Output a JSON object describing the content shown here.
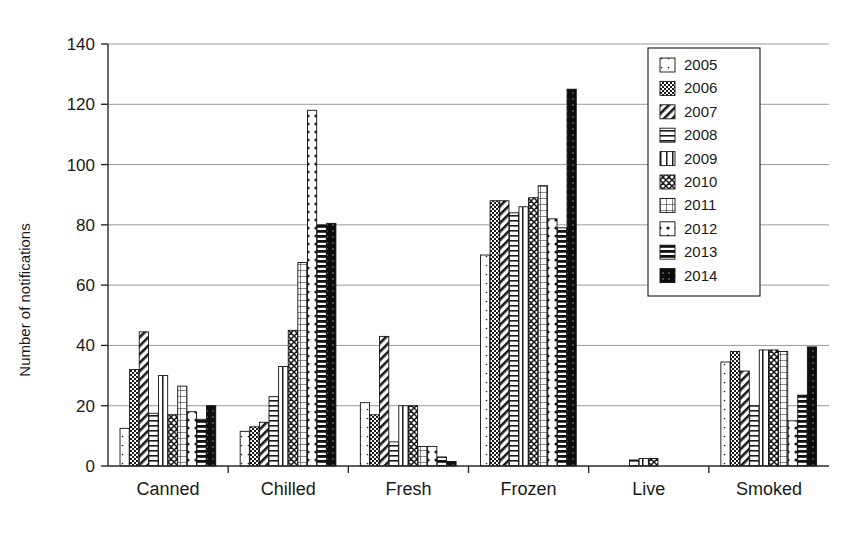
{
  "chart_data": {
    "type": "bar",
    "title": "",
    "xlabel": "",
    "ylabel": "Number of notifications",
    "ylim": [
      0,
      140
    ],
    "yticks": [
      0,
      20,
      40,
      60,
      80,
      100,
      120,
      140
    ],
    "grid": true,
    "legend_position": "top-right",
    "categories": [
      "Canned",
      "Chilled",
      "Fresh",
      "Frozen",
      "Live",
      "Smoked"
    ],
    "series": [
      {
        "name": "2005",
        "pattern": "sparse-dots",
        "values": [
          12.5,
          11.5,
          21.0,
          70.0,
          0.0,
          34.5
        ]
      },
      {
        "name": "2006",
        "pattern": "checker-dark",
        "values": [
          32.0,
          13.0,
          17.0,
          88.0,
          0.0,
          38.0
        ]
      },
      {
        "name": "2007",
        "pattern": "diagonal-left",
        "values": [
          44.5,
          14.5,
          43.0,
          88.0,
          0.0,
          31.5
        ]
      },
      {
        "name": "2008",
        "pattern": "horizontal-lines",
        "values": [
          17.5,
          23.0,
          8.0,
          84.0,
          2.0,
          20.0
        ]
      },
      {
        "name": "2009",
        "pattern": "vertical-lines",
        "values": [
          30.0,
          33.0,
          20.0,
          86.0,
          2.5,
          38.5
        ]
      },
      {
        "name": "2010",
        "pattern": "zigzag",
        "values": [
          17.0,
          45.0,
          20.0,
          89.0,
          2.5,
          38.5
        ]
      },
      {
        "name": "2011",
        "pattern": "grid-cross",
        "values": [
          26.5,
          67.5,
          6.5,
          93.0,
          0.0,
          38.0
        ]
      },
      {
        "name": "2012",
        "pattern": "dot-grid",
        "values": [
          18.0,
          118.0,
          6.5,
          82.0,
          0.0,
          15.0
        ]
      },
      {
        "name": "2013",
        "pattern": "thick-horizontal",
        "values": [
          15.5,
          80.0,
          3.0,
          79.0,
          0.0,
          23.5
        ]
      },
      {
        "name": "2014",
        "pattern": "solid-black",
        "values": [
          20.0,
          80.5,
          1.5,
          125.0,
          0.0,
          39.5
        ]
      }
    ]
  },
  "axis": {
    "y_title": "Number of notifications",
    "y_ticks": [
      "0",
      "20",
      "40",
      "60",
      "80",
      "100",
      "120",
      "140"
    ]
  },
  "legend": {
    "items": [
      {
        "label": "2005"
      },
      {
        "label": "2006"
      },
      {
        "label": "2007"
      },
      {
        "label": "2008"
      },
      {
        "label": "2009"
      },
      {
        "label": "2010"
      },
      {
        "label": "2011"
      },
      {
        "label": "2012"
      },
      {
        "label": "2013"
      },
      {
        "label": "2014"
      }
    ]
  },
  "colors": {
    "ink": "#111111",
    "grid": "#9a9a9a",
    "axis": "#2a2a2a",
    "background": "#ffffff"
  }
}
